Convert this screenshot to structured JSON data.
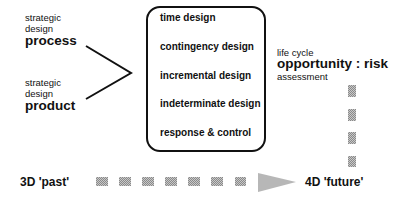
{
  "left_inputs": [
    {
      "line1": "strategic",
      "line2": "design",
      "main": "process"
    },
    {
      "line1": "strategic",
      "line2": "design",
      "main": "product"
    }
  ],
  "box": {
    "items": [
      "time design",
      "contingency design",
      "incremental design",
      "indeterminate design",
      "response &  control"
    ]
  },
  "assessment": {
    "line1": "life  cycle",
    "main": "opportunity : risk",
    "line3": "assessment"
  },
  "timeline": {
    "start_label": "3D  'past'",
    "end_label": "4D  'future'"
  },
  "colors": {
    "ink": "#111111",
    "dash_dark": "#8a8a8a",
    "dash_light": "#c8c8c8"
  }
}
